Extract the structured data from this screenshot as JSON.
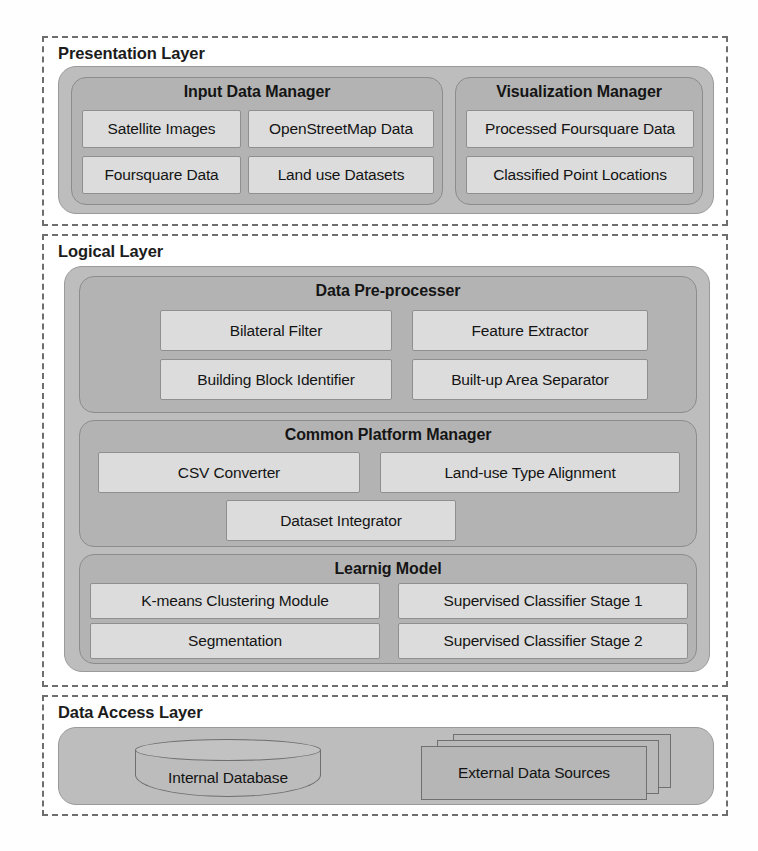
{
  "diagram": {
    "colors": {
      "layer_border": "#6e6e6e",
      "group_fill": "#bdbdbd",
      "manager_fill": "#b3b3b3",
      "leaf_fill": "#dcdcdc",
      "text": "#141414",
      "background": "#ffffff"
    }
  },
  "layers": {
    "presentation": {
      "title": "Presentation Layer",
      "managers": [
        {
          "title": "Input Data Manager",
          "components": [
            "Satellite Images",
            "OpenStreetMap Data",
            "Foursquare Data",
            "Land use Datasets"
          ]
        },
        {
          "title": "Visualization Manager",
          "components": [
            "Processed Foursquare Data",
            "Classified Point Locations"
          ]
        }
      ]
    },
    "logical": {
      "title": "Logical Layer",
      "managers": [
        {
          "title": "Data Pre-processer",
          "components": [
            "Bilateral Filter",
            "Feature Extractor",
            "Building Block Identifier",
            "Built-up Area Separator"
          ]
        },
        {
          "title": "Common Platform Manager",
          "components": [
            "CSV Converter",
            "Land-use Type Alignment",
            "Dataset Integrator"
          ]
        },
        {
          "title": "Learnig Model",
          "components": [
            "K-means Clustering Module",
            "Supervised Classifier Stage 1",
            "Segmentation",
            "Supervised Classifier Stage 2"
          ]
        }
      ]
    },
    "data_access": {
      "title": "Data Access Layer",
      "stores": [
        {
          "label": "Internal Database",
          "shape": "cylinder"
        },
        {
          "label": "External Data Sources",
          "shape": "document-stack"
        }
      ]
    }
  }
}
